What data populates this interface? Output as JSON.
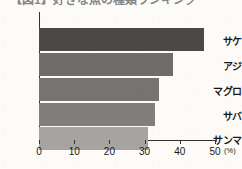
{
  "title": {
    "text": "【図1】好きな魚の種類ランキング",
    "clipped": true
  },
  "chart_data": {
    "type": "bar",
    "orientation": "horizontal",
    "title": "【図1】好きな魚の種類ランキング",
    "categories": [
      "サケ",
      "アジ",
      "マグロ",
      "サバ",
      "サンマ"
    ],
    "values": [
      47,
      38,
      34,
      33,
      31
    ],
    "series": [
      {
        "name": "割合",
        "values": [
          47,
          38,
          34,
          33,
          31
        ]
      }
    ],
    "bar_colors": [
      "#4b4845",
      "#6f6d69",
      "#767471",
      "#817f7b",
      "#a6a4a0"
    ],
    "xlabel": "",
    "ylabel": "",
    "unit": "(%)",
    "xlim": [
      0,
      50
    ],
    "xticks": [
      0,
      10,
      20,
      30,
      40,
      50
    ],
    "xtick_labels": [
      "0",
      "10",
      "20",
      "30",
      "40",
      "50"
    ],
    "grid": false,
    "legend": false
  },
  "axis": {
    "unit_suffix": "(%)"
  }
}
